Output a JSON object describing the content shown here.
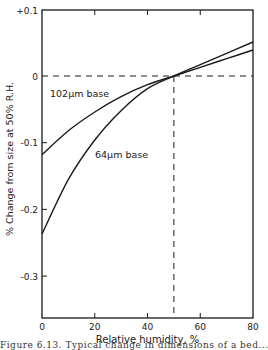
{
  "chart_data": {
    "type": "line",
    "title": "",
    "xlabel": "Relative humidity, %",
    "ylabel": "% Change from size at 50% R.H.",
    "xlim": [
      0,
      80
    ],
    "ylim": [
      -0.36,
      0.1
    ],
    "xticks": [
      0,
      20,
      40,
      60,
      80
    ],
    "xtick_labels": [
      "0",
      "20",
      "40",
      "60",
      "80"
    ],
    "yticks": [
      0.1,
      0,
      -0.1,
      -0.2,
      -0.3
    ],
    "ytick_labels": [
      "+0.1",
      "0",
      "-0.1",
      "-0.2",
      "-0.3"
    ],
    "grid": false,
    "reference_lines": {
      "horizontal_y": 0,
      "vertical_x": 50,
      "style": "dashed"
    },
    "series": [
      {
        "name": "102μm base",
        "x": [
          0,
          10,
          20,
          30,
          40,
          50,
          60,
          70,
          80
        ],
        "values": [
          -0.118,
          -0.082,
          -0.054,
          -0.031,
          -0.013,
          0.0,
          0.013,
          0.026,
          0.039
        ]
      },
      {
        "name": "64μm base",
        "x": [
          0,
          10,
          20,
          30,
          40,
          50,
          60,
          70,
          80
        ],
        "values": [
          -0.237,
          -0.155,
          -0.096,
          -0.052,
          -0.019,
          0.0,
          0.017,
          0.034,
          0.051
        ]
      }
    ],
    "annotations": [
      "102μm base",
      "64μm base"
    ]
  },
  "labels": {
    "ylabel": "% Change from size at 50% R.H.",
    "xlabel": "Relative humidity, %",
    "series_a": "102μm base",
    "series_b": "64μm base",
    "caption": "Figure 6.13. Typical change in dimensions of a bed..."
  }
}
